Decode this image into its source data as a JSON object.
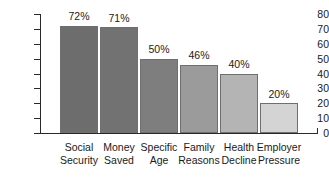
{
  "chart_data": {
    "type": "bar",
    "title": "",
    "subtitle": "",
    "xlabel": "",
    "ylabel": "",
    "ylim": [
      0,
      80
    ],
    "yticks": [
      0,
      10,
      20,
      30,
      40,
      50,
      60,
      70,
      80
    ],
    "grid": false,
    "legend": null,
    "categories": [
      "Social Security",
      "Money Saved",
      "Specific Age",
      "Family Reasons",
      "Health Decline",
      "Employer Pressure"
    ],
    "category_lines": [
      [
        "Social",
        "Security"
      ],
      [
        "Money",
        "Saved"
      ],
      [
        "Specific",
        "Age"
      ],
      [
        "Family",
        "Reasons"
      ],
      [
        "Health",
        "Decline"
      ],
      [
        "Employer",
        "Pressure"
      ]
    ],
    "values": [
      72,
      71,
      50,
      46,
      40,
      20
    ],
    "data_labels": [
      "72%",
      "71%",
      "50%",
      "46%",
      "40%",
      "20%"
    ],
    "bar_colors": [
      "#6d6d6d",
      "#727272",
      "#7e7e7e",
      "#9b9b9b",
      "#b4b4b4",
      "#d4d4d4"
    ],
    "bar_border_color": "#6f6f6f",
    "axis_color": "#2a2a2a",
    "background": "#ffffff"
  }
}
